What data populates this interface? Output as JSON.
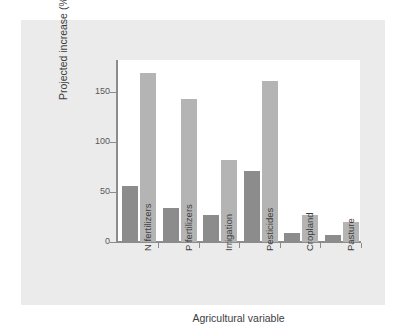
{
  "chart_data": {
    "type": "bar",
    "title": "",
    "subtitle": "",
    "xlabel": "Agricultural variable",
    "ylabel": "Projected increase (%)",
    "categories": [
      "N fertilizers",
      "P fertilizers",
      "Irrigation",
      "Pesticides",
      "Cropland",
      "Pasture"
    ],
    "series": [
      {
        "name": "dark-series",
        "color": "#8c8c8c",
        "values": [
          56,
          34,
          27,
          71,
          9,
          7
        ]
      },
      {
        "name": "light-series",
        "color": "#b4b4b4",
        "values": [
          169,
          143,
          82,
          161,
          27,
          20
        ]
      }
    ],
    "ylim": [
      0,
      182
    ],
    "yticks": [
      0,
      50,
      100,
      150
    ],
    "ytick_labels": [
      "0",
      "50",
      "100",
      "150"
    ],
    "grid": false,
    "legend": "none",
    "annotations": []
  },
  "figure": {
    "panel_color": "#ebebeb",
    "plot_background": "#ffffff",
    "axis_color": "#8c8c8c"
  }
}
